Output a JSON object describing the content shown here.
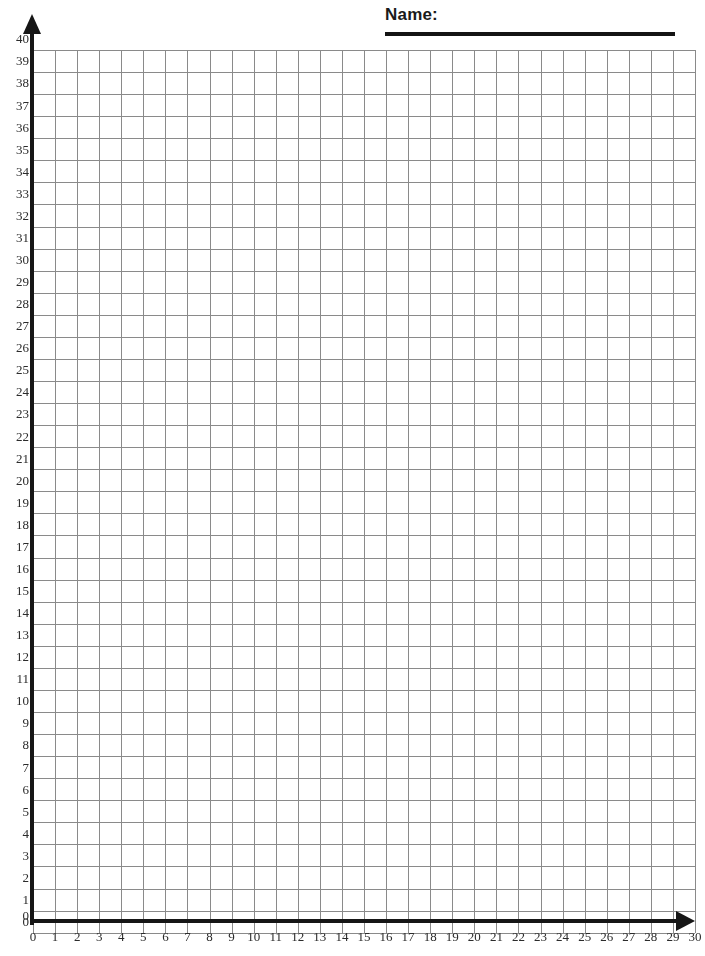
{
  "header": {
    "name_label": "Name:",
    "rule_name": "name-write-in-line"
  },
  "chart_data": {
    "type": "grid",
    "title": "",
    "xlabel": "",
    "ylabel": "",
    "xlim": [
      0,
      30
    ],
    "ylim": [
      0,
      40
    ],
    "x_tick_step": 1,
    "y_tick_step": 1,
    "grid": true,
    "series": [],
    "x_ticks": [
      0,
      1,
      2,
      3,
      4,
      5,
      6,
      7,
      8,
      9,
      10,
      11,
      12,
      13,
      14,
      15,
      16,
      17,
      18,
      19,
      20,
      21,
      22,
      23,
      24,
      25,
      26,
      27,
      28,
      29,
      30
    ],
    "y_ticks": [
      0,
      1,
      2,
      3,
      4,
      5,
      6,
      7,
      8,
      9,
      10,
      11,
      12,
      13,
      14,
      15,
      16,
      17,
      18,
      19,
      20,
      21,
      22,
      23,
      24,
      25,
      26,
      27,
      28,
      29,
      30,
      31,
      32,
      33,
      34,
      35,
      36,
      37,
      38,
      39,
      40
    ],
    "colors": {
      "grid_line": "#8a8a8a",
      "axis": "#161616",
      "background": "#ffffff",
      "tick_text": "#2b2b2b"
    }
  },
  "geometry": {
    "origin_x": 33,
    "origin_y": 921,
    "unit_px": 22.066,
    "plot_width_units": 30,
    "plot_height_units": 40
  }
}
